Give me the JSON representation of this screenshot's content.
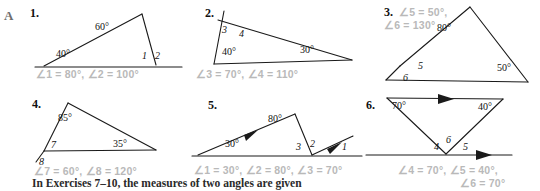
{
  "section": {
    "letter": "A"
  },
  "problems": [
    {
      "number": "1.",
      "figure_labels": [
        "60°",
        "40°",
        "1",
        "2"
      ],
      "answer": "∠1 = 80°, ∠2 = 100°"
    },
    {
      "number": "2.",
      "figure_labels": [
        "3",
        "4",
        "40°",
        "30°"
      ],
      "answer": "∠3 = 70°, ∠4 = 110°"
    },
    {
      "number": "3.",
      "figure_labels": [
        "80°",
        "50°",
        "5",
        "6"
      ],
      "answer_line1": "∠5 = 50°,",
      "answer_line2": "∠6 = 130°"
    },
    {
      "number": "4.",
      "figure_labels": [
        "85°",
        "35°",
        "7",
        "8"
      ],
      "answer": "∠7 = 60°,  ∠8 = 120°"
    },
    {
      "number": "5.",
      "figure_labels": [
        "80°",
        "30°",
        "3",
        "2",
        "1"
      ],
      "answer": "∠1 = 30°,  ∠2 = 80°,  ∠3 = 70°"
    },
    {
      "number": "6.",
      "figure_labels": [
        "70°",
        "40°",
        "4",
        "6",
        "5"
      ],
      "answer_line1": "∠4 = 70°, ∠5 = 40°,",
      "answer_line2": "∠6 = 70°"
    }
  ],
  "footer": {
    "text": "In Exercises 7–10, the measures of two angles are given"
  },
  "colors": {
    "ink": "#1a1a1a",
    "answer_gray": "#b9b9b9",
    "section_gray": "#6e6e6e"
  }
}
